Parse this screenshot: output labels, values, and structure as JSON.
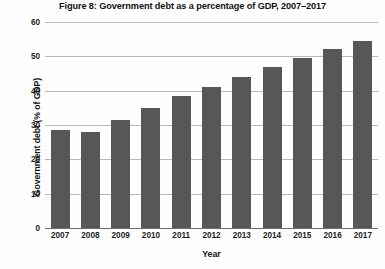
{
  "chart_data": {
    "type": "bar",
    "title": "Figure 8: Government debt as a percentage of GDP, 2007–2017",
    "xlabel": "Year",
    "ylabel": "Government debt (% of GDP)",
    "categories": [
      "2007",
      "2008",
      "2009",
      "2010",
      "2011",
      "2012",
      "2013",
      "2014",
      "2015",
      "2016",
      "2017"
    ],
    "values": [
      28.5,
      28,
      31.5,
      35,
      38.5,
      41,
      44,
      47,
      49.5,
      52,
      54.5
    ],
    "ylim": [
      0,
      60
    ],
    "yticks": [
      0,
      10,
      20,
      30,
      40,
      50,
      60
    ],
    "grid": true,
    "legend": "none",
    "series_color": "#575757",
    "grid_color": "#b9b9b9",
    "background": "#fefefe"
  }
}
